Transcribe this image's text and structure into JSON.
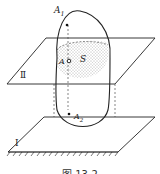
{
  "figure": {
    "caption": "图 13-2",
    "labels": {
      "point_a1": "A",
      "point_a1_sub": "1",
      "point_a2": "A",
      "point_a2_sub": "2",
      "point_a": "A",
      "region_s": "S",
      "plane_ii": "Ⅱ",
      "plane_i": "Ⅰ"
    },
    "colors": {
      "stroke": "#222222",
      "background": "#ffffff",
      "stipple": "#555555"
    }
  }
}
